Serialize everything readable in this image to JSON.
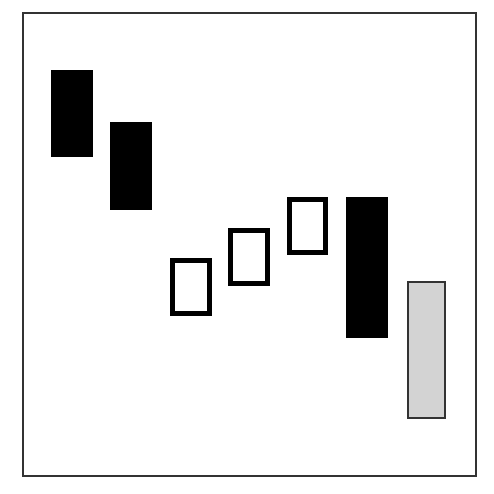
{
  "chart_data": {
    "type": "candlestick",
    "title": "",
    "xlabel": "",
    "ylabel": "",
    "grid": false,
    "legend": null,
    "frame": {
      "left": 22,
      "top": 12,
      "right": 477,
      "bottom": 477,
      "color": "#333333"
    },
    "y_axis_note": "No tick labels shown; values are relative heights (higher = larger), derived from pixel positions within the frame (0 at bottom, 465 at top).",
    "categories": [
      "1",
      "2",
      "3",
      "4",
      "5",
      "6",
      "7"
    ],
    "candles": [
      {
        "index": 1,
        "style": "filled",
        "color": "#000000",
        "x": 51,
        "width": 42,
        "top_px": 70,
        "bottom_px": 157,
        "open": 407,
        "close": 320
      },
      {
        "index": 2,
        "style": "filled",
        "color": "#000000",
        "x": 110,
        "width": 42,
        "top_px": 122,
        "bottom_px": 210,
        "open": 355,
        "close": 267
      },
      {
        "index": 3,
        "style": "hollow",
        "color": "#000000",
        "x": 170,
        "width": 42,
        "top_px": 258,
        "bottom_px": 316,
        "open": 161,
        "close": 219
      },
      {
        "index": 4,
        "style": "hollow",
        "color": "#000000",
        "x": 228,
        "width": 42,
        "top_px": 228,
        "bottom_px": 286,
        "open": 191,
        "close": 249
      },
      {
        "index": 5,
        "style": "hollow",
        "color": "#000000",
        "x": 287,
        "width": 41,
        "top_px": 197,
        "bottom_px": 255,
        "open": 222,
        "close": 280
      },
      {
        "index": 6,
        "style": "filled",
        "color": "#000000",
        "x": 346,
        "width": 42,
        "top_px": 197,
        "bottom_px": 338,
        "open": 280,
        "close": 139
      },
      {
        "index": 7,
        "style": "gray",
        "color": "#d3d3d3",
        "x": 407,
        "width": 39,
        "top_px": 281,
        "bottom_px": 419,
        "open": 196,
        "close": 58
      }
    ]
  }
}
